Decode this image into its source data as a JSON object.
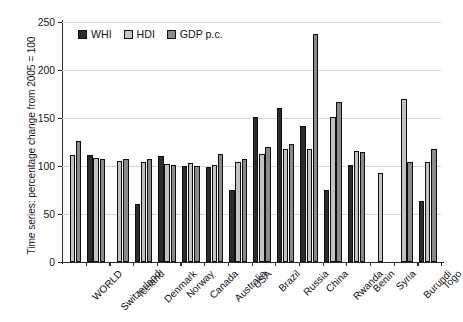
{
  "chart_data": {
    "type": "bar",
    "title": "",
    "xlabel": "",
    "ylabel": "Time series: percentage change from 2005 = 100",
    "ylim": [
      0,
      250
    ],
    "yticks": [
      0,
      50,
      100,
      150,
      200,
      250
    ],
    "ytick_labels": [
      "0",
      "50",
      "100",
      "150",
      "200",
      "250"
    ],
    "grid": true,
    "legend_position": "top-left",
    "categories": [
      "WORLD",
      "Switzerland",
      "Iceland",
      "Denmark",
      "Norway",
      "Canada",
      "Australia",
      "USA",
      "Brazil",
      "Russia",
      "China",
      "Rwanda",
      "Benin",
      "Syria",
      "Burundi",
      "Togo"
    ],
    "series": [
      {
        "name": "WHI",
        "color": "#2c2c2c",
        "values": [
          null,
          111,
          null,
          60,
          110,
          100,
          99,
          75,
          151,
          160,
          142,
          75,
          101,
          null,
          null,
          64
        ]
      },
      {
        "name": "HDI",
        "color": "#c6c6c6",
        "values": [
          111,
          108,
          105,
          104,
          102,
          103,
          101,
          104,
          112,
          118,
          118,
          151,
          116,
          93,
          170,
          104
        ]
      },
      {
        "name": "GDP p.c.",
        "color": "#8a8a8a",
        "values": [
          126,
          107,
          107,
          107,
          101,
          100,
          112,
          107,
          120,
          123,
          237,
          167,
          115,
          null,
          104,
          118
        ]
      }
    ]
  },
  "legend": {
    "items": [
      {
        "label": "WHI",
        "swatch": "whi"
      },
      {
        "label": "HDI",
        "swatch": "hdi"
      },
      {
        "label": "GDP p.c.",
        "swatch": "gdp"
      }
    ]
  },
  "axes": {
    "y_title": "Time series: percentage change from 2005 = 100"
  }
}
